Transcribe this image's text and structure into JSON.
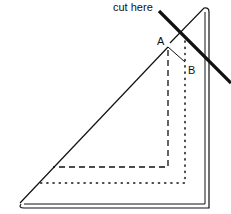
{
  "diagram": {
    "cut_label": "cut here",
    "point_a_label": "A",
    "point_b_label": "B",
    "colors": {
      "ink": "#111111",
      "background": "#ffffff"
    }
  }
}
